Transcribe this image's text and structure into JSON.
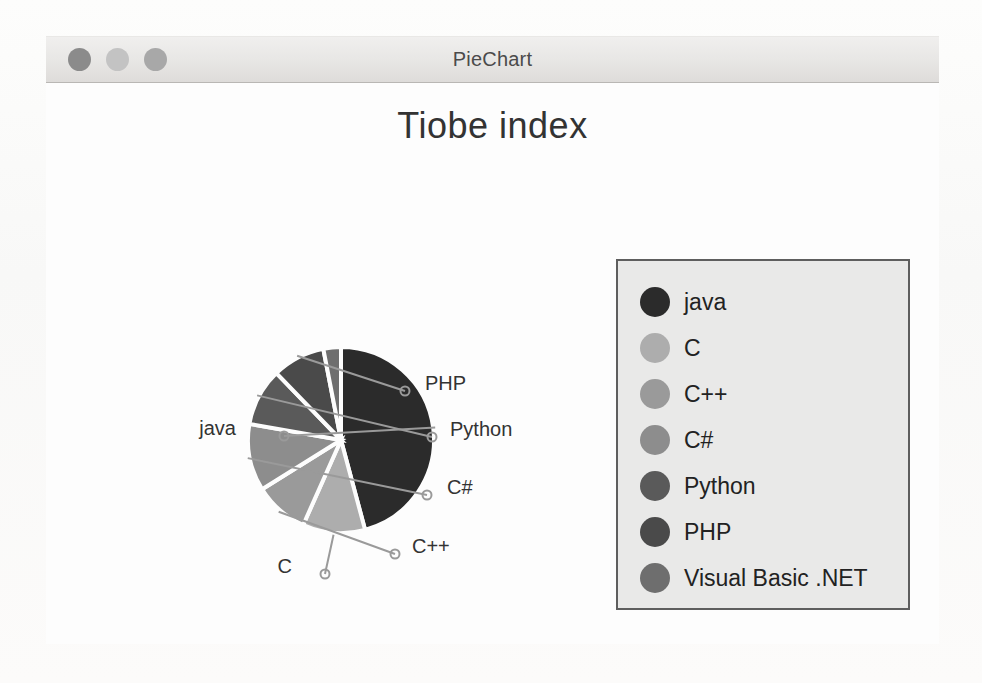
{
  "window": {
    "title": "PieChart",
    "traffic_lights": [
      {
        "name": "close-button",
        "color": "#8b8b8b"
      },
      {
        "name": "minimize-button",
        "color": "#c3c3c3"
      },
      {
        "name": "zoom-button",
        "color": "#a8a8a8"
      }
    ]
  },
  "chart_data": {
    "type": "pie",
    "title": "Tiobe index",
    "legend_position": "right",
    "start_angle_deg": 0,
    "direction": "clockwise",
    "categories": [
      "java",
      "C",
      "C++",
      "C#",
      "Python",
      "PHP",
      "Visual Basic .NET"
    ],
    "values": [
      45.8,
      10.8,
      9.4,
      11.7,
      10.0,
      9.2,
      3.1
    ],
    "units": "percent",
    "colors": [
      "#2b2b2b",
      "#adadad",
      "#9a9a9a",
      "#8d8d8d",
      "#5a5a5a",
      "#4a4a4a",
      "#6e6e6e"
    ],
    "slices": [
      {
        "label": "java",
        "value": 45.8,
        "color": "#2b2b2b",
        "start_deg": 0.0,
        "end_deg": 165.0,
        "leader_label": "java",
        "label_x": 190,
        "label_y": 347,
        "marker_x": 238,
        "marker_y": 353
      },
      {
        "label": "C",
        "value": 10.8,
        "color": "#adadad",
        "start_deg": 165.0,
        "end_deg": 204.0,
        "leader_label": "C",
        "label_x": 246,
        "label_y": 485,
        "marker_x": 279,
        "marker_y": 491
      },
      {
        "label": "C++",
        "value": 9.4,
        "color": "#9a9a9a",
        "start_deg": 204.0,
        "end_deg": 238.0,
        "leader_label": "C++",
        "label_x": 366,
        "label_y": 465,
        "marker_x": 349,
        "marker_y": 471
      },
      {
        "label": "C#",
        "value": 11.7,
        "color": "#8d8d8d",
        "start_deg": 238.0,
        "end_deg": 280.0,
        "leader_label": "C#",
        "label_x": 401,
        "label_y": 406,
        "marker_x": 381,
        "marker_y": 412
      },
      {
        "label": "Python",
        "value": 10.0,
        "color": "#5a5a5a",
        "start_deg": 280.0,
        "end_deg": 316.0,
        "leader_label": "Python",
        "label_x": 404,
        "label_y": 348,
        "marker_x": 386,
        "marker_y": 354
      },
      {
        "label": "PHP",
        "value": 9.2,
        "color": "#4a4a4a",
        "start_deg": 316.0,
        "end_deg": 349.0,
        "leader_label": "PHP",
        "label_x": 379,
        "label_y": 302,
        "marker_x": 359,
        "marker_y": 308
      },
      {
        "label": "Visual Basic .NET",
        "value": 3.1,
        "color": "#6e6e6e",
        "start_deg": 349.0,
        "end_deg": 360.0,
        "leader_label": "",
        "label_x": 0,
        "label_y": 0,
        "marker_x": 0,
        "marker_y": 0
      }
    ],
    "geometry": {
      "cx": 295,
      "cy": 357,
      "r": 93
    }
  },
  "legend": {
    "items": [
      {
        "label": "java",
        "color": "#2b2b2b"
      },
      {
        "label": "C",
        "color": "#adadad"
      },
      {
        "label": "C++",
        "color": "#9a9a9a"
      },
      {
        "label": "C#",
        "color": "#8d8d8d"
      },
      {
        "label": "Python",
        "color": "#5a5a5a"
      },
      {
        "label": "PHP",
        "color": "#4a4a4a"
      },
      {
        "label": "Visual Basic .NET",
        "color": "#6e6e6e"
      }
    ]
  }
}
